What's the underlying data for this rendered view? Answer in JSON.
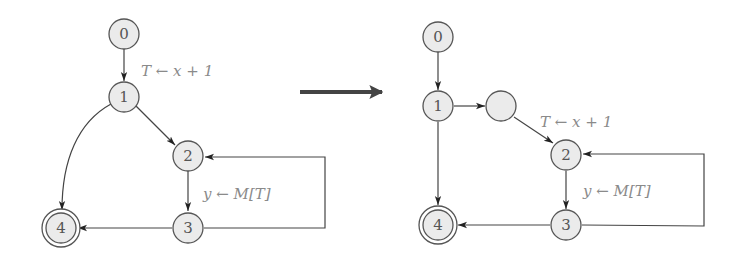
{
  "diagram": {
    "type": "control-flow-graph-transformation",
    "transform_arrow": {
      "from": [
        300,
        92
      ],
      "to": [
        384,
        92
      ],
      "color": "#444444"
    },
    "colors": {
      "node_fill": "#ebebeb",
      "node_stroke": "#555555",
      "edge": "#444444",
      "label_text": "#8a8a8a"
    },
    "left_graph": {
      "nodes": [
        {
          "id": "0",
          "label": "0",
          "x": 124,
          "y": 34,
          "accepting": false
        },
        {
          "id": "1",
          "label": "1",
          "x": 124,
          "y": 97,
          "accepting": false
        },
        {
          "id": "2",
          "label": "2",
          "x": 188,
          "y": 155,
          "accepting": false
        },
        {
          "id": "3",
          "label": "3",
          "x": 188,
          "y": 227,
          "accepting": false
        },
        {
          "id": "4",
          "label": "4",
          "x": 58,
          "y": 227,
          "accepting": true
        }
      ],
      "edges": [
        {
          "from": "0",
          "to": "1",
          "label": "T ← x + 1"
        },
        {
          "from": "1",
          "to": "2",
          "label": ""
        },
        {
          "from": "1",
          "to": "4",
          "label": "",
          "curved": true
        },
        {
          "from": "2",
          "to": "3",
          "label": "y ← M[T]"
        },
        {
          "from": "3",
          "to": "4",
          "label": ""
        },
        {
          "from": "3",
          "to": "2",
          "label": "",
          "loop": true
        }
      ],
      "labels": {
        "assign_T": "T ← x + 1",
        "assign_y": "y ← M[T]"
      }
    },
    "right_graph": {
      "nodes": [
        {
          "id": "0",
          "label": "0",
          "x": 438,
          "y": 37,
          "accepting": false
        },
        {
          "id": "1",
          "label": "1",
          "x": 438,
          "y": 106,
          "accepting": false
        },
        {
          "id": "new",
          "label": "",
          "x": 502,
          "y": 106,
          "accepting": false
        },
        {
          "id": "2",
          "label": "2",
          "x": 566,
          "y": 155,
          "accepting": false
        },
        {
          "id": "3",
          "label": "3",
          "x": 566,
          "y": 225,
          "accepting": false
        },
        {
          "id": "4",
          "label": "4",
          "x": 438,
          "y": 225,
          "accepting": true
        }
      ],
      "edges": [
        {
          "from": "0",
          "to": "1",
          "label": ""
        },
        {
          "from": "1",
          "to": "new",
          "label": ""
        },
        {
          "from": "new",
          "to": "2",
          "label": "T ← x + 1"
        },
        {
          "from": "1",
          "to": "4",
          "label": ""
        },
        {
          "from": "2",
          "to": "3",
          "label": "y ← M[T]"
        },
        {
          "from": "3",
          "to": "4",
          "label": ""
        },
        {
          "from": "3",
          "to": "2",
          "label": "",
          "loop": true
        }
      ],
      "labels": {
        "assign_T": "T ← x + 1",
        "assign_y": "y ← M[T]"
      }
    }
  }
}
